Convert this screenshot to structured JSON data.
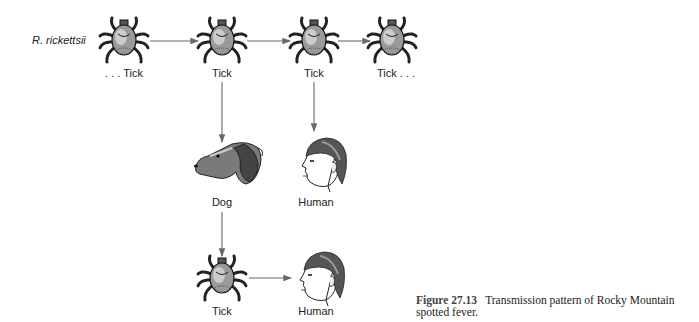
{
  "diagram": {
    "organism_label": "R. rickettsii",
    "nodes": [
      {
        "id": "tick1",
        "type": "tick",
        "label": ". . . Tick",
        "icon": "tick-icon"
      },
      {
        "id": "tick2",
        "type": "tick",
        "label": "Tick",
        "icon": "tick-icon"
      },
      {
        "id": "tick3",
        "type": "tick",
        "label": "Tick",
        "icon": "tick-icon"
      },
      {
        "id": "tick4",
        "type": "tick",
        "label": "Tick . . .",
        "icon": "tick-icon"
      },
      {
        "id": "dog",
        "type": "dog",
        "label": "Dog",
        "icon": "dog-head-icon"
      },
      {
        "id": "human1",
        "type": "human",
        "label": "Human",
        "icon": "human-head-icon"
      },
      {
        "id": "tick5",
        "type": "tick",
        "label": "Tick",
        "icon": "tick-icon"
      },
      {
        "id": "human2",
        "type": "human",
        "label": "Human",
        "icon": "human-head-icon"
      }
    ],
    "edges": [
      {
        "from": "tick1",
        "to": "tick2"
      },
      {
        "from": "tick2",
        "to": "tick3"
      },
      {
        "from": "tick3",
        "to": "tick4"
      },
      {
        "from": "tick2",
        "to": "dog"
      },
      {
        "from": "tick3",
        "to": "human1"
      },
      {
        "from": "dog",
        "to": "tick5"
      },
      {
        "from": "tick5",
        "to": "human2"
      }
    ],
    "colors": {
      "arrow": "#6a6a6a",
      "ink": "#1a1a1a",
      "background": "#ffffff"
    }
  },
  "caption": {
    "figure_number": "Figure 27.13",
    "text": "Transmission pattern of Rocky Mountain spotted fever."
  }
}
